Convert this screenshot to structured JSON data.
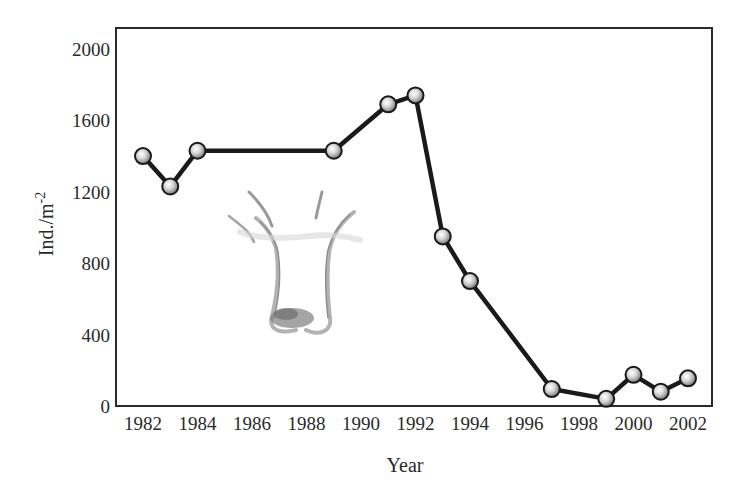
{
  "chart_data": {
    "type": "line",
    "title": "",
    "xlabel": "Year",
    "ylabel": "Ind./m",
    "ylabel_superscript": "-2",
    "xlim": [
      1981,
      2003
    ],
    "ylim": [
      0,
      2000
    ],
    "x_ticks": [
      1982,
      1984,
      1986,
      1988,
      1990,
      1992,
      1994,
      1996,
      1998,
      2000,
      2002
    ],
    "y_ticks": [
      0,
      400,
      800,
      1200,
      1600,
      2000
    ],
    "grid": false,
    "legend": null,
    "x": [
      1982,
      1983,
      1984,
      1989,
      1991,
      1992,
      1993,
      1994,
      1997,
      1999,
      2000,
      2001,
      2002
    ],
    "series": [
      {
        "name": "Density",
        "values": [
          1400,
          1230,
          1430,
          1430,
          1690,
          1740,
          950,
          700,
          95,
          40,
          175,
          80,
          155
        ],
        "marker": "sphere",
        "color": "#1a1a1a"
      }
    ],
    "annotations": [
      {
        "type": "illustration",
        "description": "sketch of U-shaped burrowing worm"
      }
    ]
  },
  "colors": {
    "line": "#1a1a1a",
    "frame": "#2a2a2a",
    "marker_fill_light": "#f4f4f4",
    "marker_fill_dark": "#8a8a8a"
  }
}
